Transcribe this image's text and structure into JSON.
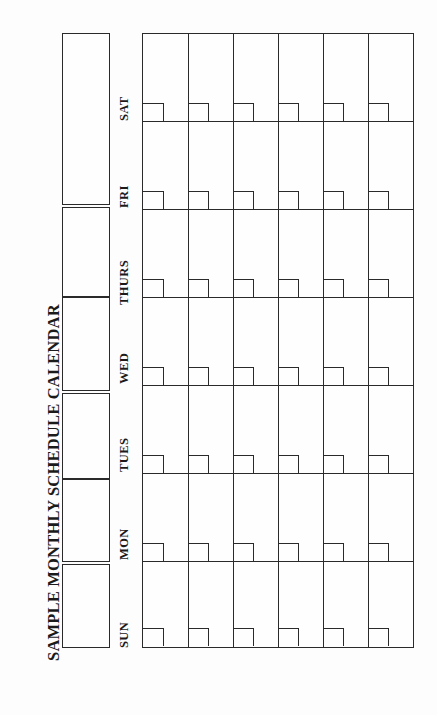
{
  "document": {
    "title": "SAMPLE MONTHLY SCHEDULE CALENDAR",
    "orientation": "rotated-90-ccw",
    "background_color": "#fdfdfd",
    "ink_color": "#2a2a2a"
  },
  "categories": {
    "heading_note": "Four blank category blocks along the left margin",
    "items": [
      {
        "label": "FAMILY",
        "order": 1
      },
      {
        "label": "PERSONAL",
        "order": 2
      },
      {
        "label": "JOB-RELATED",
        "order": 3
      },
      {
        "label": "MISC.",
        "order": 4
      }
    ]
  },
  "calendar": {
    "days": [
      {
        "label": "SUN"
      },
      {
        "label": "MON"
      },
      {
        "label": "TUES"
      },
      {
        "label": "WED"
      },
      {
        "label": "THURS"
      },
      {
        "label": "FRI"
      },
      {
        "label": "SAT"
      }
    ],
    "week_count": 6,
    "cells_blank": true,
    "date_box_per_cell": true
  }
}
